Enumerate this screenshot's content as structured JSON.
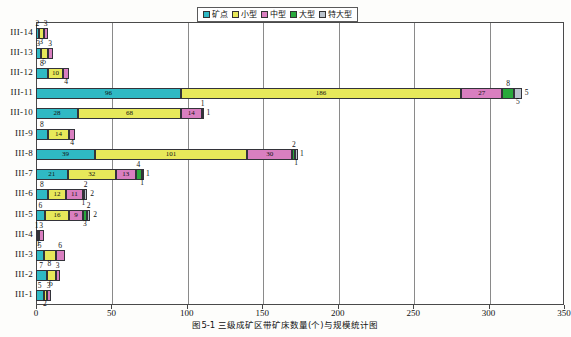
{
  "caption": "图5-1  三级成矿区带矿床数量(个)与规模统计图",
  "legend": {
    "items": [
      {
        "label": "矿点",
        "color": "#2fb9c4",
        "name": "legend-kuangdian"
      },
      {
        "label": "小型",
        "color": "#e7e85a",
        "name": "legend-xiaoxing"
      },
      {
        "label": "中型",
        "color": "#d97fc0",
        "name": "legend-zhongxing"
      },
      {
        "label": "大型",
        "color": "#29a83c",
        "name": "legend-daxing"
      },
      {
        "label": "特大型",
        "color": "#b9c2cc",
        "name": "legend-tedaxing"
      }
    ]
  },
  "chart_data": {
    "type": "bar",
    "orientation": "horizontal",
    "stacked": true,
    "title": "图5-1  三级成矿区带矿床数量(个)与规模统计图",
    "xlabel": "",
    "ylabel": "",
    "xlim": [
      0,
      350
    ],
    "xticks": [
      0,
      50,
      100,
      150,
      200,
      250,
      300,
      350
    ],
    "grid": "vertical",
    "legend_position": "top-center",
    "categories": [
      "III-1",
      "III-2",
      "III-3",
      "III-4",
      "III-5",
      "III-6",
      "III-7",
      "III-8",
      "III-9",
      "III-10",
      "III-11",
      "III-12",
      "III-13",
      "III-14"
    ],
    "series": [
      {
        "name": "矿点",
        "color": "#2fb9c4",
        "values": [
          5,
          7,
          5,
          1,
          6,
          8,
          21,
          39,
          8,
          28,
          96,
          8,
          3,
          2
        ]
      },
      {
        "name": "小型",
        "color": "#e7e85a",
        "values": [
          2,
          6,
          8,
          1,
          16,
          12,
          32,
          101,
          14,
          68,
          186,
          10,
          5,
          3
        ]
      },
      {
        "name": "中型",
        "color": "#d97fc0",
        "values": [
          3,
          3,
          6,
          3,
          9,
          11,
          13,
          30,
          4,
          14,
          27,
          4,
          3,
          3
        ]
      },
      {
        "name": "大型",
        "color": "#29a83c",
        "values": [
          0,
          0,
          0,
          0,
          3,
          1,
          4,
          2,
          0,
          1,
          8,
          0,
          0,
          0
        ]
      },
      {
        "name": "特大型",
        "color": "#b9c2cc",
        "values": [
          0,
          0,
          0,
          0,
          2,
          2,
          1,
          1,
          0,
          0,
          5,
          0,
          0,
          0
        ]
      }
    ]
  },
  "xaxis": {
    "ticks": [
      {
        "value": 0,
        "label": "0"
      },
      {
        "value": 50,
        "label": "50"
      },
      {
        "value": 100,
        "label": "100"
      },
      {
        "value": 150,
        "label": "150"
      },
      {
        "value": 200,
        "label": "200"
      },
      {
        "value": 250,
        "label": "250"
      },
      {
        "value": 300,
        "label": "300"
      },
      {
        "value": 350,
        "label": "350"
      }
    ]
  },
  "yaxis": {
    "labels": [
      "III-14",
      "III-13",
      "III-12",
      "III-11",
      "III-10",
      "III-9",
      "III-8",
      "III-7",
      "III-6",
      "III-5",
      "III-4",
      "III-3",
      "III-2",
      "III-1"
    ]
  }
}
